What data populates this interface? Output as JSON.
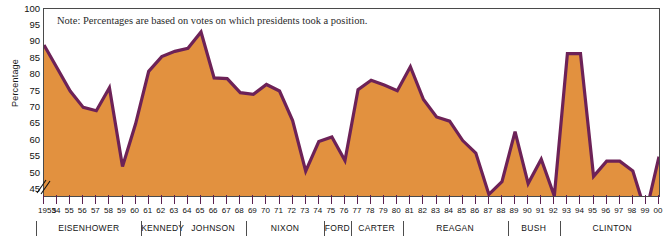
{
  "note": "Note: Percentages are based on votes on which presidents took a position.",
  "axes": {
    "ylabel": "Percentage",
    "yticks": [
      100,
      95,
      90,
      85,
      80,
      75,
      70,
      65,
      60,
      55,
      50,
      45
    ],
    "ylim": [
      43,
      100
    ],
    "axis_break": true,
    "xlabels": [
      "1953",
      "54",
      "55",
      "56",
      "57",
      "58",
      "59",
      "60",
      "61",
      "62",
      "63",
      "64",
      "65",
      "66",
      "67",
      "68",
      "69",
      "70",
      "71",
      "72",
      "73",
      "74",
      "75",
      "76",
      "77",
      "78",
      "79",
      "80",
      "81",
      "82",
      "83",
      "84",
      "85",
      "86",
      "87",
      "88",
      "89",
      "90",
      "91",
      "92",
      "93",
      "94",
      "95",
      "96",
      "97",
      "98",
      "99",
      "00"
    ]
  },
  "presidents": [
    {
      "name": "EISENHOWER",
      "start": 1953,
      "end": 1960
    },
    {
      "name": "KENNEDY",
      "start": 1961,
      "end": 1963
    },
    {
      "name": "JOHNSON",
      "start": 1964,
      "end": 1968
    },
    {
      "name": "NIXON",
      "start": 1969,
      "end": 1974
    },
    {
      "name": "FORD",
      "start": 1975,
      "end": 1976
    },
    {
      "name": "CARTER",
      "start": 1977,
      "end": 1980
    },
    {
      "name": "REAGAN",
      "start": 1981,
      "end": 1988
    },
    {
      "name": "BUSH",
      "start": 1989,
      "end": 1992
    },
    {
      "name": "CLINTON",
      "start": 1993,
      "end": 2000
    }
  ],
  "colors": {
    "fill": "#e2913f",
    "line": "#6d2257",
    "frame": "#4a4a4a",
    "text": "#111111"
  },
  "chart_data": {
    "type": "area",
    "title": "",
    "xlabel": "",
    "ylabel": "Percentage",
    "ylim": [
      43,
      100
    ],
    "grid": false,
    "legend": "none",
    "annotations": [
      "Note: Percentages are based on votes on which presidents took a position."
    ],
    "x": [
      1953,
      1954,
      1955,
      1956,
      1957,
      1958,
      1959,
      1960,
      1961,
      1962,
      1963,
      1964,
      1965,
      1966,
      1967,
      1968,
      1969,
      1970,
      1971,
      1972,
      1973,
      1974,
      1975,
      1976,
      1977,
      1978,
      1979,
      1980,
      1981,
      1982,
      1983,
      1984,
      1985,
      1986,
      1987,
      1988,
      1989,
      1990,
      1991,
      1992,
      1993,
      1994,
      1995,
      1996,
      1997,
      1998,
      1999,
      2000
    ],
    "values": [
      89.0,
      82.0,
      75.0,
      70.0,
      69.0,
      76.0,
      52.0,
      65.0,
      81.0,
      85.5,
      87.1,
      88.0,
      93.0,
      79.0,
      78.8,
      74.5,
      74.0,
      77.0,
      75.0,
      66.0,
      50.6,
      59.6,
      61.0,
      53.8,
      75.4,
      78.3,
      76.8,
      75.1,
      82.4,
      72.4,
      67.1,
      65.8,
      59.9,
      56.1,
      43.5,
      47.4,
      62.6,
      46.8,
      54.2,
      43.0,
      86.4,
      86.4,
      49.0,
      53.6,
      53.6,
      50.6,
      37.8,
      55.0
    ],
    "series": [
      {
        "name": "Presidential success rate on congressional votes",
        "values": [
          89.0,
          82.0,
          75.0,
          70.0,
          69.0,
          76.0,
          52.0,
          65.0,
          81.0,
          85.5,
          87.1,
          88.0,
          93.0,
          79.0,
          78.8,
          74.5,
          74.0,
          77.0,
          75.0,
          66.0,
          50.6,
          59.6,
          61.0,
          53.8,
          75.4,
          78.3,
          76.8,
          75.1,
          82.4,
          72.4,
          67.1,
          65.8,
          59.9,
          56.1,
          43.5,
          47.4,
          62.6,
          46.8,
          54.2,
          43.0,
          86.4,
          86.4,
          49.0,
          53.6,
          53.6,
          50.6,
          37.8,
          55.0
        ]
      }
    ]
  }
}
